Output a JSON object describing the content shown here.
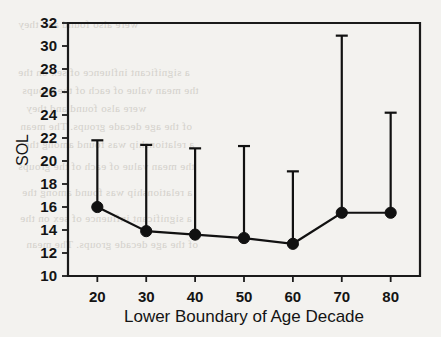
{
  "figure": {
    "background_color": "#f3f2ef",
    "ink_color": "#141414",
    "caption_bleed_through": [
      "a significant influence of sex on the",
      "the mean value of each of the groups",
      "were also found and they",
      "of the age decade groups. The mean",
      "a relationship was found among the"
    ]
  },
  "chart_data": {
    "type": "line",
    "title": "",
    "subtitle": "",
    "xlabel": "Lower Boundary of Age Decade",
    "ylabel": "SOL",
    "x": [
      20,
      30,
      40,
      50,
      60,
      70,
      80
    ],
    "xtick_labels": [
      "20",
      "30",
      "40",
      "50",
      "60",
      "70",
      "80"
    ],
    "ytick_labels": [
      "10",
      "12",
      "14",
      "16",
      "18",
      "20",
      "22",
      "24",
      "26",
      "28",
      "30",
      "32"
    ],
    "yticks": [
      10,
      12,
      14,
      16,
      18,
      20,
      22,
      24,
      26,
      28,
      30,
      32
    ],
    "xlim": [
      14,
      86
    ],
    "ylim": [
      10,
      32
    ],
    "grid": false,
    "legend": "none",
    "marker": "filled-circle",
    "error_bar_style": "upper-only-with-cap",
    "series": [
      {
        "name": "SOL",
        "values": [
          16.0,
          13.9,
          13.6,
          13.3,
          12.8,
          15.5,
          15.5
        ],
        "error_upper": [
          21.8,
          21.4,
          21.1,
          21.3,
          19.1,
          30.9,
          24.2
        ]
      }
    ],
    "connected_points": [
      20,
      30,
      40,
      50,
      60,
      70,
      80
    ]
  }
}
